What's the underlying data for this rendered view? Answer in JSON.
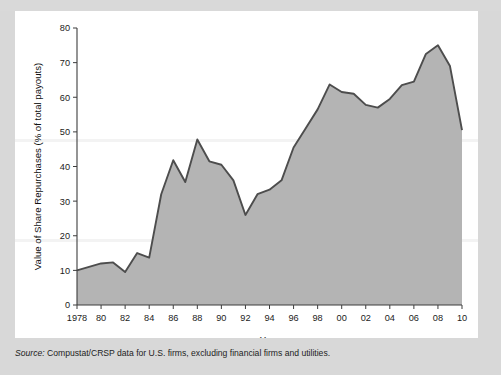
{
  "figure": {
    "panel_bg": "#ffffff",
    "page_bg": "#d8d8d8",
    "source_label": "Source:",
    "source_text": " Compustat/CRSP data for U.S. firms, excluding financial firms and utilities."
  },
  "chart_data": {
    "type": "area",
    "title": "",
    "subtitle": "",
    "xlabel": "Year",
    "ylabel": "Value of Share Repurchases (% of total payouts)",
    "xlim": [
      1978,
      2010
    ],
    "ylim": [
      0,
      80
    ],
    "grid": false,
    "legend": null,
    "fill_color": "#b4b4b4",
    "line_color": "#4d4d4d",
    "y_ticks": [
      0,
      10,
      20,
      30,
      40,
      50,
      60,
      70,
      80
    ],
    "y_ticklabels": [
      "0",
      "10",
      "20",
      "30",
      "40",
      "50",
      "60",
      "70",
      "80"
    ],
    "x_ticks": [
      1978,
      1980,
      1982,
      1984,
      1986,
      1988,
      1990,
      1992,
      1994,
      1996,
      1998,
      2000,
      2002,
      2004,
      2006,
      2008,
      2010
    ],
    "x_ticklabels": [
      "1978",
      "80",
      "82",
      "84",
      "86",
      "88",
      "90",
      "92",
      "94",
      "96",
      "98",
      "00",
      "02",
      "04",
      "06",
      "08",
      "10"
    ],
    "x": [
      1978,
      1979,
      1980,
      1981,
      1982,
      1983,
      1984,
      1985,
      1986,
      1987,
      1988,
      1989,
      1990,
      1991,
      1992,
      1993,
      1994,
      1995,
      1996,
      1997,
      1998,
      1999,
      2000,
      2001,
      2002,
      2003,
      2004,
      2005,
      2006,
      2007,
      2008,
      2009,
      2010
    ],
    "values": [
      10.0,
      11.0,
      12.0,
      12.3,
      9.5,
      15.0,
      13.7,
      32.0,
      41.8,
      35.5,
      47.8,
      41.5,
      40.5,
      36.0,
      26.0,
      32.0,
      33.3,
      36.0,
      45.5,
      51.0,
      56.5,
      63.7,
      61.5,
      61.0,
      57.8,
      57.0,
      59.5,
      63.5,
      64.5,
      72.5,
      75.0,
      69.0,
      50.5
    ]
  }
}
